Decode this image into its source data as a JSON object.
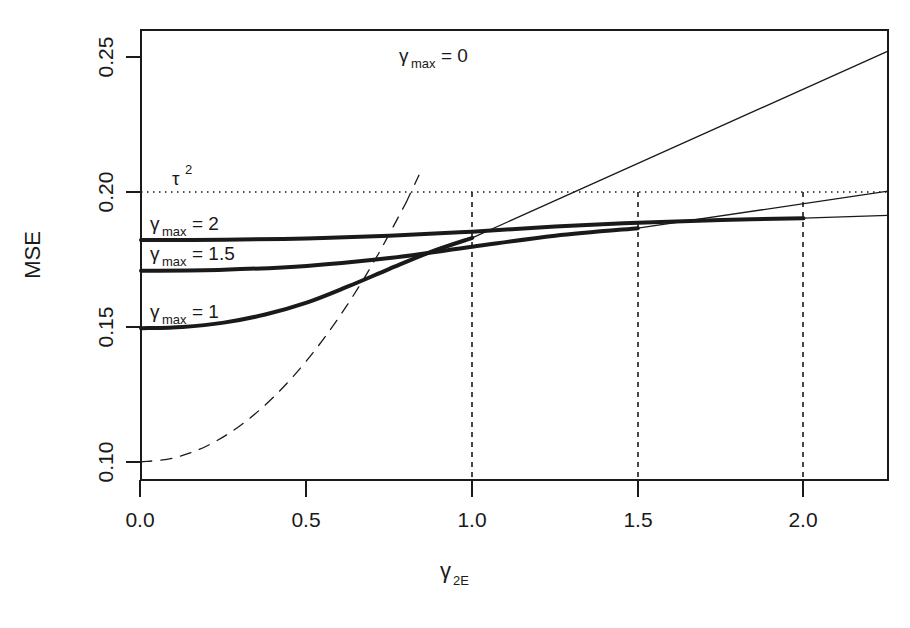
{
  "figure": {
    "background": "#ffffff",
    "ink": "#1a1a1a"
  },
  "axes": {
    "y_title": "MSE",
    "x_title_base": "γ",
    "x_title_sub": "2E",
    "x_ticks": [
      "0.0",
      "0.5",
      "1.0",
      "1.5",
      "2.0"
    ],
    "y_ticks": [
      "0.10",
      "0.15",
      "0.20",
      "0.25"
    ]
  },
  "annotations": {
    "tau": "τ",
    "tau_sup": "2",
    "gmax0": "γ",
    "gmax0_sub": "max",
    "gmax0_val": "= 0",
    "gmax1": "γ",
    "gmax1_sub": "max",
    "gmax1_val": "= 1",
    "gmax15": "γ",
    "gmax15_sub": "max",
    "gmax15_val": "= 1.5",
    "gmax2": "γ",
    "gmax2_sub": "max",
    "gmax2_val": "= 2"
  },
  "chart_data": {
    "type": "line",
    "title": "",
    "xlabel": "γ_2E",
    "ylabel": "MSE",
    "xlim": [
      0.0,
      2.255
    ],
    "ylim": [
      0.0933,
      0.26
    ],
    "xticks": [
      0.0,
      0.5,
      1.0,
      1.5,
      2.0
    ],
    "yticks": [
      0.1,
      0.15,
      0.2,
      0.25
    ],
    "grid": false,
    "legend": "inline-annotations",
    "reference_lines": [
      {
        "name": "tau-squared",
        "orientation": "horizontal",
        "value": 0.2,
        "style": "dotted",
        "label": "τ²"
      },
      {
        "name": "vline-1.0",
        "orientation": "vertical",
        "value": 1.0,
        "style": "dashed",
        "from": 0.0933,
        "to": 0.2
      },
      {
        "name": "vline-1.5",
        "orientation": "vertical",
        "value": 1.5,
        "style": "dashed",
        "from": 0.0933,
        "to": 0.2
      },
      {
        "name": "vline-2.0",
        "orientation": "vertical",
        "value": 2.0,
        "style": "dashed",
        "from": 0.0933,
        "to": 0.2
      }
    ],
    "series": [
      {
        "name": "gamma_max = 0",
        "label": "γmax= 0",
        "style": "dashed",
        "width": "thin",
        "x": [
          0.0,
          0.1,
          0.2,
          0.3,
          0.4,
          0.5,
          0.6,
          0.7,
          0.8
        ],
        "y": [
          0.1,
          0.1015,
          0.106,
          0.1135,
          0.124,
          0.1375,
          0.154,
          0.1735,
          0.196
        ],
        "x_extrapolated": [
          0.8,
          0.84
        ],
        "y_extrapolated": [
          0.196,
          0.2065
        ]
      },
      {
        "name": "gamma_max = 1 (solid segment)",
        "label": "γmax= 1",
        "style": "solid",
        "width": "thick",
        "x": [
          0.0,
          0.125,
          0.25,
          0.375,
          0.5,
          0.625,
          0.75,
          0.875,
          1.0
        ],
        "y": [
          0.1495,
          0.15,
          0.1516,
          0.1546,
          0.159,
          0.165,
          0.1715,
          0.1778,
          0.183
        ]
      },
      {
        "name": "gamma_max = 1 (thin continuation)",
        "style": "solid",
        "width": "thin",
        "x": [
          1.0,
          2.255
        ],
        "y": [
          0.183,
          0.2522
        ]
      },
      {
        "name": "gamma_max = 1.5 (solid segment)",
        "label": "γmax= 1.5",
        "style": "solid",
        "width": "thick",
        "x": [
          0.0,
          0.25,
          0.5,
          0.75,
          1.0,
          1.25,
          1.5
        ],
        "y": [
          0.1708,
          0.1712,
          0.1726,
          0.1755,
          0.1797,
          0.1838,
          0.1866
        ]
      },
      {
        "name": "gamma_max = 1.5 (thin continuation)",
        "style": "solid",
        "width": "thin",
        "x": [
          1.5,
          2.255
        ],
        "y": [
          0.1866,
          0.2003
        ]
      },
      {
        "name": "gamma_max = 2 (solid segment)",
        "label": "γmax= 2",
        "style": "solid",
        "width": "thick",
        "x": [
          0.0,
          0.25,
          0.5,
          0.75,
          1.0,
          1.25,
          1.5,
          1.75,
          2.0
        ],
        "y": [
          0.1822,
          0.1823,
          0.1828,
          0.1838,
          0.1853,
          0.1872,
          0.1886,
          0.1896,
          0.1903
        ]
      },
      {
        "name": "gamma_max = 2 (thin continuation)",
        "style": "solid",
        "width": "thin",
        "x": [
          2.0,
          2.255
        ],
        "y": [
          0.1903,
          0.1913
        ]
      }
    ]
  }
}
